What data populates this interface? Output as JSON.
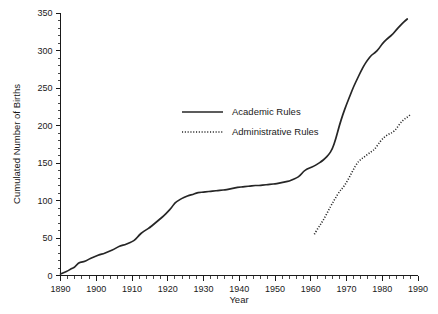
{
  "chart_data": {
    "type": "line",
    "title": "",
    "xlabel": "Year",
    "ylabel": "Cumulated Number of Births",
    "xlim": [
      1890,
      1990
    ],
    "ylim": [
      0,
      350
    ],
    "grid": false,
    "legend_position": "center-left",
    "x_ticks": [
      1890,
      1900,
      1910,
      1920,
      1930,
      1940,
      1950,
      1960,
      1970,
      1980,
      1990
    ],
    "x_tick_labels": [
      "1890",
      "1900",
      "1910",
      "1920",
      "1930",
      "1940",
      "1950",
      "1960",
      "1970",
      "1980",
      "1990"
    ],
    "x_minor_step": 2,
    "y_ticks": [
      0,
      50,
      100,
      150,
      200,
      250,
      300,
      350
    ],
    "y_tick_labels": [
      "0",
      "50",
      "100",
      "150",
      "200",
      "250",
      "300",
      "350"
    ],
    "y_minor_step": 10,
    "series": [
      {
        "name": "Academic Rules",
        "style": "solid",
        "color": "#262626",
        "points": [
          [
            1890,
            2
          ],
          [
            1891,
            4
          ],
          [
            1892,
            6
          ],
          [
            1893,
            9
          ],
          [
            1894,
            11
          ],
          [
            1895,
            17
          ],
          [
            1896,
            18
          ],
          [
            1897,
            19
          ],
          [
            1898,
            22
          ],
          [
            1899,
            24
          ],
          [
            1900,
            26
          ],
          [
            1901,
            28
          ],
          [
            1902,
            29
          ],
          [
            1903,
            31
          ],
          [
            1904,
            33
          ],
          [
            1905,
            35
          ],
          [
            1906,
            38
          ],
          [
            1907,
            40
          ],
          [
            1908,
            41
          ],
          [
            1909,
            43
          ],
          [
            1910,
            45
          ],
          [
            1911,
            48
          ],
          [
            1912,
            54
          ],
          [
            1913,
            58
          ],
          [
            1914,
            61
          ],
          [
            1915,
            64
          ],
          [
            1916,
            68
          ],
          [
            1917,
            72
          ],
          [
            1918,
            76
          ],
          [
            1919,
            80
          ],
          [
            1920,
            85
          ],
          [
            1921,
            90
          ],
          [
            1922,
            97
          ],
          [
            1923,
            100
          ],
          [
            1924,
            103
          ],
          [
            1925,
            105
          ],
          [
            1926,
            107
          ],
          [
            1927,
            108
          ],
          [
            1928,
            110
          ],
          [
            1929,
            111
          ],
          [
            1930,
            111
          ],
          [
            1931,
            112
          ],
          [
            1932,
            112
          ],
          [
            1933,
            113
          ],
          [
            1934,
            113
          ],
          [
            1935,
            114
          ],
          [
            1936,
            114
          ],
          [
            1937,
            115
          ],
          [
            1938,
            116
          ],
          [
            1939,
            117
          ],
          [
            1940,
            118
          ],
          [
            1941,
            118
          ],
          [
            1942,
            119
          ],
          [
            1943,
            119
          ],
          [
            1944,
            120
          ],
          [
            1945,
            120
          ],
          [
            1946,
            120
          ],
          [
            1947,
            121
          ],
          [
            1948,
            121
          ],
          [
            1949,
            122
          ],
          [
            1950,
            122
          ],
          [
            1951,
            123
          ],
          [
            1952,
            124
          ],
          [
            1953,
            125
          ],
          [
            1954,
            126
          ],
          [
            1955,
            128
          ],
          [
            1956,
            130
          ],
          [
            1957,
            133
          ],
          [
            1958,
            139
          ],
          [
            1959,
            142
          ],
          [
            1960,
            144
          ],
          [
            1961,
            146
          ],
          [
            1962,
            149
          ],
          [
            1963,
            152
          ],
          [
            1964,
            156
          ],
          [
            1965,
            161
          ],
          [
            1966,
            168
          ],
          [
            1967,
            182
          ],
          [
            1968,
            200
          ],
          [
            1969,
            215
          ],
          [
            1970,
            228
          ],
          [
            1971,
            240
          ],
          [
            1972,
            252
          ],
          [
            1973,
            262
          ],
          [
            1974,
            272
          ],
          [
            1975,
            281
          ],
          [
            1976,
            288
          ],
          [
            1977,
            294
          ],
          [
            1978,
            297
          ],
          [
            1979,
            302
          ],
          [
            1980,
            309
          ],
          [
            1981,
            314
          ],
          [
            1982,
            318
          ],
          [
            1983,
            322
          ],
          [
            1984,
            328
          ],
          [
            1985,
            333
          ],
          [
            1986,
            338
          ],
          [
            1987,
            342
          ]
        ]
      },
      {
        "name": "Administrative Rules",
        "style": "dotted",
        "color": "#262626",
        "points": [
          [
            1961,
            55
          ],
          [
            1962,
            63
          ],
          [
            1963,
            70
          ],
          [
            1964,
            78
          ],
          [
            1965,
            87
          ],
          [
            1966,
            96
          ],
          [
            1967,
            104
          ],
          [
            1968,
            112
          ],
          [
            1969,
            117
          ],
          [
            1970,
            124
          ],
          [
            1971,
            133
          ],
          [
            1972,
            142
          ],
          [
            1973,
            150
          ],
          [
            1974,
            155
          ],
          [
            1975,
            158
          ],
          [
            1976,
            162
          ],
          [
            1977,
            165
          ],
          [
            1978,
            169
          ],
          [
            1979,
            176
          ],
          [
            1980,
            182
          ],
          [
            1981,
            186
          ],
          [
            1982,
            189
          ],
          [
            1983,
            191
          ],
          [
            1984,
            196
          ],
          [
            1985,
            203
          ],
          [
            1986,
            208
          ],
          [
            1987,
            211
          ],
          [
            1988,
            215
          ]
        ]
      }
    ],
    "legend": [
      {
        "label": "Academic Rules",
        "style": "solid"
      },
      {
        "label": "Administrative Rules",
        "style": "dotted"
      }
    ]
  }
}
